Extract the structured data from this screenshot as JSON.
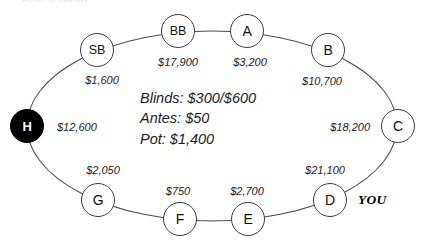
{
  "diagram": {
    "title_cut_off": "POKER HAND",
    "hero_marker": "YOU",
    "center_info": {
      "blinds": "Blinds: $300/$600",
      "antes": "Antes: $50",
      "pot": "Pot: $1,400"
    },
    "seats": [
      {
        "id": "H",
        "label": "H",
        "stack": "$12,600",
        "x": 27,
        "y": 126,
        "lx": 57,
        "ly": 127,
        "anchor": "c-left",
        "hero": true,
        "filled": true
      },
      {
        "id": "SB",
        "label": "SB",
        "stack": "$1,600",
        "x": 97,
        "y": 50,
        "lx": 102,
        "ly": 80,
        "anchor": "c-center",
        "hero": false,
        "filled": false
      },
      {
        "id": "BB",
        "label": "BB",
        "stack": "$17,900",
        "x": 178,
        "y": 31,
        "lx": 178,
        "ly": 62,
        "anchor": "c-center",
        "hero": false,
        "filled": false
      },
      {
        "id": "A",
        "label": "A",
        "stack": "$3,200",
        "x": 247,
        "y": 31,
        "lx": 250,
        "ly": 62,
        "anchor": "c-center",
        "hero": false,
        "filled": false
      },
      {
        "id": "B",
        "label": "B",
        "stack": "$10,700",
        "x": 328,
        "y": 50,
        "lx": 322,
        "ly": 81,
        "anchor": "c-center",
        "hero": false,
        "filled": false
      },
      {
        "id": "C",
        "label": "C",
        "stack": "$18,200",
        "x": 398,
        "y": 126,
        "lx": 370,
        "ly": 127,
        "anchor": "c-right",
        "hero": false,
        "filled": false
      },
      {
        "id": "D",
        "label": "D",
        "stack": "$21,100",
        "x": 330,
        "y": 200,
        "lx": 325,
        "ly": 170,
        "anchor": "c-center",
        "hero": false,
        "filled": false
      },
      {
        "id": "E",
        "label": "E",
        "stack": "$2,700",
        "x": 248,
        "y": 219,
        "lx": 247,
        "ly": 191,
        "anchor": "c-center",
        "hero": false,
        "filled": false
      },
      {
        "id": "F",
        "label": "F",
        "stack": "$750",
        "x": 180,
        "y": 219,
        "lx": 178,
        "ly": 191,
        "anchor": "c-center",
        "hero": false,
        "filled": false
      },
      {
        "id": "G",
        "label": "G",
        "stack": "$2,050",
        "x": 98,
        "y": 200,
        "lx": 103,
        "ly": 170,
        "anchor": "c-center",
        "hero": false,
        "filled": false
      }
    ],
    "ring": {
      "cx": 212,
      "cy": 126,
      "rx": 185,
      "ry": 95,
      "stroke": "#4a4a4a",
      "stroke_width": 1.1
    },
    "colors": {
      "ink": "#1b1b1b",
      "outline": "#3c3c3c",
      "hero_fill": "#000000",
      "hero_text": "#ffffff",
      "background": "#ffffff"
    }
  },
  "chart_data": {
    "type": "table",
    "categories": [
      "H",
      "SB",
      "BB",
      "A",
      "B",
      "C",
      "D",
      "E",
      "F",
      "G"
    ],
    "values": [
      12600,
      1600,
      17900,
      3200,
      10700,
      18200,
      21100,
      2700,
      750,
      2050
    ],
    "ylabel": "Chip stack ($)",
    "annotations": {
      "small_blind": 300,
      "big_blind": 600,
      "ante": 50,
      "pot": 1400,
      "hero_seat": "D",
      "button_or_dark_seat": "H"
    }
  }
}
